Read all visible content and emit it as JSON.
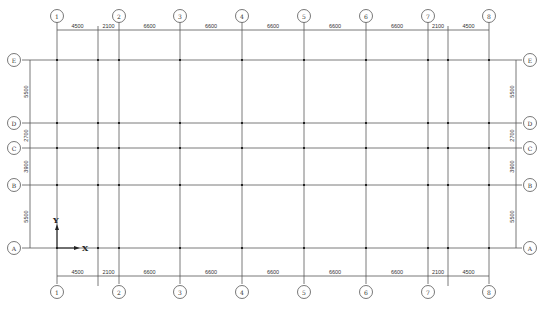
{
  "drawing": {
    "colors": {
      "line": "#6b6b6b",
      "node": "#222222",
      "text": "#333333",
      "background": "#ffffff"
    },
    "columns": [
      {
        "label": "1",
        "x": 57
      },
      {
        "label": "2",
        "x": 119
      },
      {
        "label": "3",
        "x": 180
      },
      {
        "label": "4",
        "x": 242
      },
      {
        "label": "5",
        "x": 304
      },
      {
        "label": "6",
        "x": 366
      },
      {
        "label": "7",
        "x": 428
      },
      {
        "label": "8",
        "x": 489
      }
    ],
    "aux_columns": [
      {
        "x": 98
      },
      {
        "x": 448
      }
    ],
    "rows": [
      {
        "label": "E",
        "y": 60
      },
      {
        "label": "D",
        "y": 123
      },
      {
        "label": "C",
        "y": 148
      },
      {
        "label": "B",
        "y": 185
      },
      {
        "label": "A",
        "y": 248
      }
    ],
    "top_dimensions": [
      "4500",
      "2100",
      "6600",
      "6600",
      "6600",
      "6600",
      "6600",
      "2100",
      "4500"
    ],
    "bottom_dimensions": [
      "4500",
      "2100",
      "6600",
      "6600",
      "6600",
      "6600",
      "6600",
      "2100",
      "4500"
    ],
    "left_dimensions": [
      "5500",
      "2700",
      "3900",
      "5500"
    ],
    "right_dimensions": [
      "5500",
      "2700",
      "3900",
      "5500"
    ],
    "axis": {
      "x_label": "X",
      "y_label": "Y"
    }
  }
}
